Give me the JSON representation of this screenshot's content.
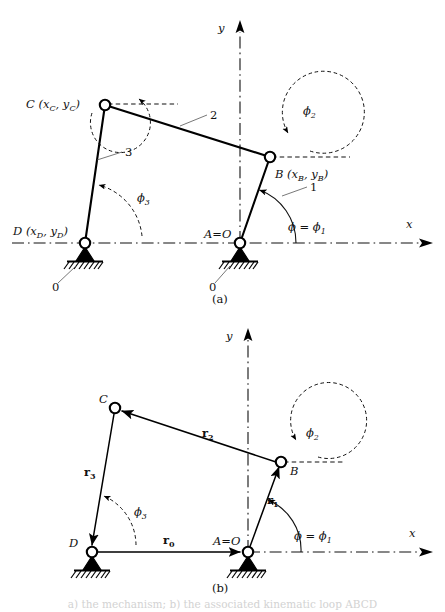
{
  "figure": {
    "title_cropped": "a) the mechanism; b) the associated kinematic loop ABCD",
    "panels": [
      {
        "id": "a",
        "caption": "(a)",
        "axes": {
          "x_label": "x",
          "y_label": "y"
        },
        "joints": [
          {
            "name": "C",
            "label": "C (x",
            "label_sub1": "C",
            "label_mid": ", y",
            "label_sub2": "C",
            "label_end": ")"
          },
          {
            "name": "B",
            "label": "B (x",
            "label_sub1": "B",
            "label_mid": ", y",
            "label_sub2": "B",
            "label_end": ")"
          },
          {
            "name": "D",
            "label": "D (x",
            "label_sub1": "D",
            "label_mid": ", y",
            "label_sub2": "D",
            "label_end": ")"
          },
          {
            "name": "A",
            "label": "A=O"
          }
        ],
        "link_numbers": [
          {
            "id": "link-1",
            "text": "1"
          },
          {
            "id": "link-2",
            "text": "2"
          },
          {
            "id": "link-3",
            "text": "3"
          },
          {
            "id": "ground-left",
            "text": "0"
          },
          {
            "id": "ground-right",
            "text": "0"
          }
        ],
        "angles": [
          {
            "id": "phi-1",
            "symbol": "ϕ",
            "eq": " = ϕ",
            "sub": "1"
          },
          {
            "id": "phi-2",
            "symbol": "ϕ",
            "sub": "2"
          },
          {
            "id": "phi-3",
            "symbol": "ϕ",
            "sub": "3"
          }
        ]
      },
      {
        "id": "b",
        "caption": "(b)",
        "axes": {
          "x_label": "x",
          "y_label": "y"
        },
        "joints": [
          {
            "name": "C",
            "label": "C"
          },
          {
            "name": "B",
            "label": "B"
          },
          {
            "name": "D",
            "label": "D"
          },
          {
            "name": "A",
            "label": "A=O"
          }
        ],
        "vectors": [
          {
            "id": "r0",
            "symbol": "r",
            "sub": "0"
          },
          {
            "id": "r1",
            "symbol": "r",
            "sub": "1"
          },
          {
            "id": "r2",
            "symbol": "r",
            "sub": "2"
          },
          {
            "id": "r3",
            "symbol": "r",
            "sub": "3"
          }
        ],
        "angles": [
          {
            "id": "phi-1",
            "symbol": "ϕ",
            "eq": " = ϕ",
            "sub": "1"
          },
          {
            "id": "phi-2",
            "symbol": "ϕ",
            "sub": "2"
          },
          {
            "id": "phi-3",
            "symbol": "ϕ",
            "sub": "3"
          }
        ]
      }
    ],
    "colors": {
      "ink": "#000000",
      "background": "#ffffff",
      "leader": "#555555"
    }
  }
}
